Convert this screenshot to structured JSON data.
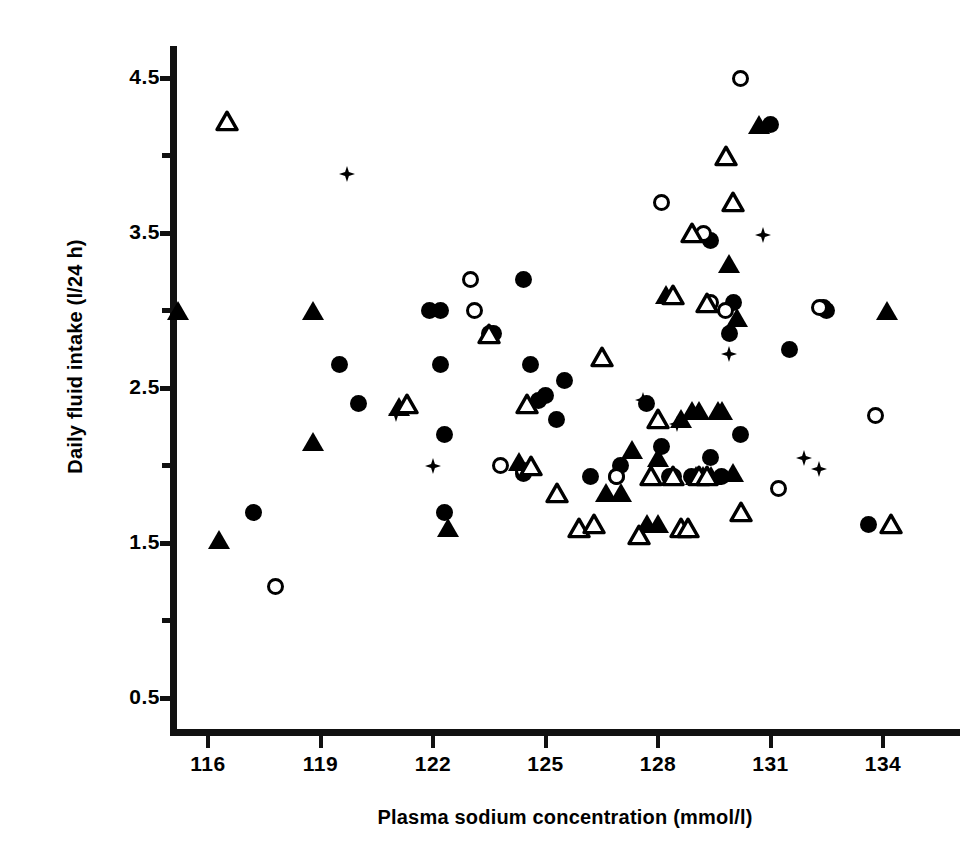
{
  "figure": {
    "background_color": "#ffffff",
    "ink_color": "#000000"
  },
  "axes": {
    "x_title": "Plasma sodium concentration (mmol/l)",
    "y_title": "Daily fluid intake (l/24 h)",
    "x_ticks": [
      "116",
      "119",
      "122",
      "125",
      "128",
      "131",
      "134"
    ],
    "y_ticks": [
      "4.5",
      "3.5",
      "2.5",
      "1.5",
      "0.5"
    ]
  },
  "chart_data": {
    "type": "scatter",
    "title": "",
    "subtitle": "",
    "xlabel": "Plasma sodium concentration (mmol/l)",
    "ylabel": "Daily fluid intake (l/24 h)",
    "xlim": [
      114.8,
      135.5
    ],
    "ylim": [
      0.28,
      4.72
    ],
    "xticks": [
      116,
      119,
      122,
      125,
      128,
      131,
      134
    ],
    "yticks": [
      0.5,
      1.5,
      2.5,
      3.5,
      4.5
    ],
    "yticks_minor": [
      1.0,
      2.0,
      3.0,
      4.0
    ],
    "grid": false,
    "legend": "none",
    "annotations": [],
    "series": [
      {
        "name": "filled-circle",
        "marker": "filled-circle",
        "points": [
          [
            117.2,
            1.7
          ],
          [
            119.5,
            2.65
          ],
          [
            120.0,
            2.4
          ],
          [
            121.9,
            3.0
          ],
          [
            122.2,
            3.0
          ],
          [
            122.2,
            2.65
          ],
          [
            122.3,
            1.7
          ],
          [
            122.3,
            2.2
          ],
          [
            123.5,
            2.85
          ],
          [
            123.6,
            2.85
          ],
          [
            124.4,
            3.2
          ],
          [
            124.6,
            2.65
          ],
          [
            124.4,
            1.95
          ],
          [
            124.8,
            2.42
          ],
          [
            125.0,
            2.45
          ],
          [
            125.3,
            2.3
          ],
          [
            125.5,
            2.55
          ],
          [
            126.9,
            1.93
          ],
          [
            127.0,
            2.0
          ],
          [
            127.7,
            2.4
          ],
          [
            128.1,
            2.12
          ],
          [
            128.3,
            1.93
          ],
          [
            128.9,
            1.93
          ],
          [
            129.4,
            2.05
          ],
          [
            129.7,
            1.93
          ],
          [
            129.4,
            3.45
          ],
          [
            129.9,
            2.85
          ],
          [
            130.0,
            3.05
          ],
          [
            130.2,
            2.2
          ],
          [
            131.0,
            4.2
          ],
          [
            131.5,
            2.75
          ],
          [
            132.4,
            3.02
          ],
          [
            132.5,
            3.0
          ],
          [
            133.6,
            1.62
          ],
          [
            126.2,
            1.93
          ]
        ]
      },
      {
        "name": "open-circle",
        "marker": "open-circle",
        "points": [
          [
            117.8,
            1.22
          ],
          [
            123.0,
            3.2
          ],
          [
            123.1,
            3.0
          ],
          [
            123.8,
            2.0
          ],
          [
            124.4,
            1.97
          ],
          [
            128.1,
            3.7
          ],
          [
            129.2,
            3.5
          ],
          [
            129.4,
            3.05
          ],
          [
            129.8,
            3.0
          ],
          [
            131.2,
            1.85
          ],
          [
            132.3,
            3.02
          ],
          [
            133.8,
            2.32
          ],
          [
            130.2,
            4.5
          ],
          [
            126.9,
            1.93
          ],
          [
            128.4,
            1.93
          ]
        ]
      },
      {
        "name": "filled-triangle",
        "marker": "filled-triangle",
        "points": [
          [
            115.2,
            3.0
          ],
          [
            116.3,
            1.52
          ],
          [
            118.8,
            3.0
          ],
          [
            118.8,
            2.15
          ],
          [
            121.1,
            2.38
          ],
          [
            122.4,
            1.6
          ],
          [
            124.3,
            2.02
          ],
          [
            126.6,
            1.82
          ],
          [
            127.0,
            1.82
          ],
          [
            127.3,
            2.1
          ],
          [
            127.7,
            1.62
          ],
          [
            128.0,
            1.62
          ],
          [
            128.0,
            2.05
          ],
          [
            128.2,
            3.1
          ],
          [
            128.6,
            2.3
          ],
          [
            129.0,
            1.93
          ],
          [
            129.2,
            1.93
          ],
          [
            129.4,
            1.93
          ],
          [
            129.6,
            2.35
          ],
          [
            129.7,
            2.35
          ],
          [
            129.9,
            3.3
          ],
          [
            130.0,
            1.95
          ],
          [
            130.7,
            4.2
          ],
          [
            134.1,
            3.0
          ],
          [
            128.9,
            2.35
          ],
          [
            129.1,
            2.35
          ],
          [
            130.1,
            2.95
          ]
        ]
      },
      {
        "name": "open-triangle",
        "marker": "open-triangle",
        "points": [
          [
            116.5,
            4.22
          ],
          [
            121.3,
            2.4
          ],
          [
            123.5,
            2.85
          ],
          [
            124.5,
            2.4
          ],
          [
            124.6,
            2.0
          ],
          [
            125.3,
            1.82
          ],
          [
            125.9,
            1.6
          ],
          [
            126.5,
            2.7
          ],
          [
            127.8,
            1.93
          ],
          [
            128.4,
            3.1
          ],
          [
            128.0,
            2.3
          ],
          [
            128.9,
            3.5
          ],
          [
            128.6,
            1.6
          ],
          [
            128.8,
            1.6
          ],
          [
            129.1,
            1.93
          ],
          [
            129.3,
            1.93
          ],
          [
            129.3,
            3.05
          ],
          [
            129.8,
            4.0
          ],
          [
            130.0,
            3.7
          ],
          [
            130.2,
            1.7
          ],
          [
            134.2,
            1.62
          ],
          [
            128.4,
            1.93
          ],
          [
            127.5,
            1.55
          ],
          [
            126.3,
            1.62
          ]
        ]
      },
      {
        "name": "plus-star",
        "marker": "plus-star",
        "points": [
          [
            119.7,
            3.88
          ],
          [
            121.0,
            2.33
          ],
          [
            122.0,
            2.0
          ],
          [
            127.6,
            2.42
          ],
          [
            128.5,
            2.27
          ],
          [
            129.9,
            2.72
          ],
          [
            130.8,
            3.49
          ],
          [
            131.9,
            2.05
          ],
          [
            132.3,
            1.98
          ]
        ]
      }
    ]
  }
}
